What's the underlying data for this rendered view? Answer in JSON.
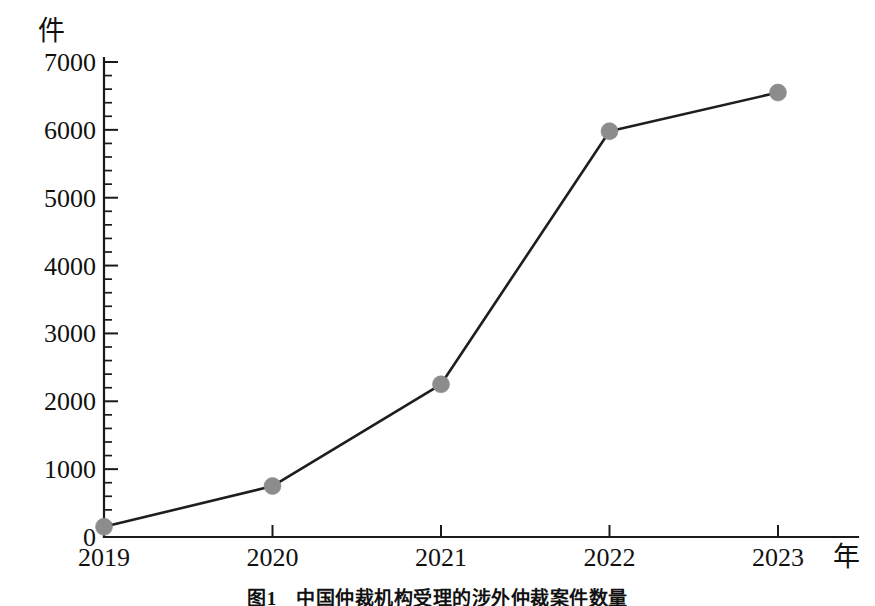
{
  "figure": {
    "unit_y": "件",
    "unit_x": "年",
    "caption": "图1　中国仲裁机构受理的涉外仲裁案件数量"
  },
  "chart_data": {
    "type": "line",
    "title": "",
    "xlabel": "年",
    "ylabel": "件",
    "categories": [
      "2019",
      "2020",
      "2021",
      "2022",
      "2023"
    ],
    "values": [
      150,
      750,
      2250,
      5980,
      6550
    ],
    "series": [
      {
        "name": "案件数量",
        "values": [
          150,
          750,
          2250,
          5980,
          6550
        ]
      }
    ],
    "ylim": [
      0,
      7000
    ],
    "ytick_labels": [
      "0",
      "1000",
      "2000",
      "3000",
      "4000",
      "5000",
      "6000",
      "7000"
    ],
    "ytick_values": [
      0,
      1000,
      2000,
      3000,
      4000,
      5000,
      6000,
      7000
    ],
    "yminor_step": 200,
    "xtick_labels": [
      "2019",
      "2020",
      "2021",
      "2022",
      "2023"
    ],
    "grid": false,
    "legend": false,
    "marker": "circle",
    "marker_color": "#8c8c8c",
    "line_color": "#1e1e1e"
  }
}
